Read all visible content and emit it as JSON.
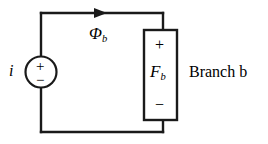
{
  "figure": {
    "type": "circuit-diagram",
    "background_color": "#ffffff",
    "line_color": "#1a1a1a"
  },
  "labels": {
    "current_source": "i",
    "flux_symbol": "Φ",
    "flux_subscript": "b",
    "mmf_symbol": "F",
    "mmf_subscript": "b",
    "branch_caption": "Branch b",
    "source_plus": "+",
    "source_minus": "−",
    "element_plus": "+",
    "element_minus": "−"
  },
  "icons": {
    "source": "circle-source-icon",
    "flux_arrow": "arrow-right-icon",
    "element": "rectangle-element-icon"
  },
  "geometry": {
    "loop": {
      "left_x": 41,
      "right_x": 163,
      "top_y": 13,
      "bottom_y": 132
    },
    "source_circle": {
      "cx": 41,
      "cy": 72,
      "r": 15.5
    },
    "element_box": {
      "x": 144,
      "y": 30,
      "width": 33,
      "height": 90
    },
    "arrow": {
      "tip_x": 107,
      "y": 13
    }
  }
}
